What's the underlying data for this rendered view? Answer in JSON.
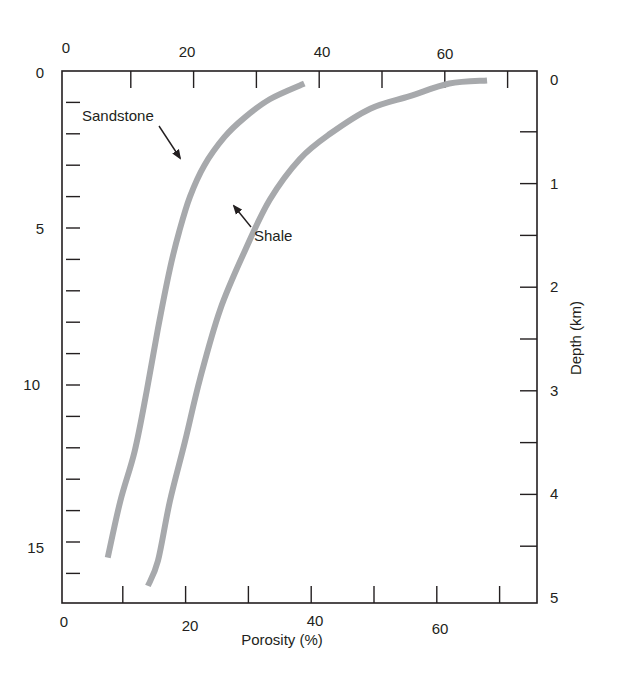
{
  "chart_data": {
    "type": "line",
    "title": "",
    "xlabel": "Porosity (%)",
    "ylabel_left": "",
    "ylabel_right": "Depth (km)",
    "left_axis_unit_note": "depth in thousands of feet (unlabeled)",
    "xlim": [
      0,
      75
    ],
    "ylim_left": [
      0,
      16.9
    ],
    "ylim_right": [
      0,
      5
    ],
    "x_ticks": [
      0,
      10,
      20,
      30,
      40,
      50,
      60,
      70
    ],
    "x_tick_labels_bottom": [
      "0",
      "20",
      "40",
      "60"
    ],
    "x_tick_labels_top": [
      "0",
      "20",
      "40",
      "60"
    ],
    "y_left_ticks": [
      0,
      1,
      2,
      3,
      4,
      5,
      6,
      7,
      8,
      9,
      10,
      11,
      12,
      13,
      14,
      15,
      16
    ],
    "y_left_tick_labels": [
      "0",
      "5",
      "10",
      "15"
    ],
    "y_right_ticks": [
      0,
      0.5,
      1,
      1.5,
      2,
      2.5,
      3,
      3.5,
      4,
      4.5,
      5
    ],
    "y_right_tick_labels": [
      "0",
      "1",
      "2",
      "3",
      "4",
      "5"
    ],
    "grid": false,
    "legend": "none (inline arrow annotations)",
    "series": [
      {
        "name": "Sandstone",
        "color": "#a7a9ac",
        "points": [
          {
            "porosity": 38.9,
            "depth": 0.4
          },
          {
            "porosity": 33.4,
            "depth": 0.9
          },
          {
            "porosity": 29.3,
            "depth": 1.5
          },
          {
            "porosity": 26.2,
            "depth": 2.1
          },
          {
            "porosity": 23.0,
            "depth": 3.0
          },
          {
            "porosity": 20.7,
            "depth": 4.0
          },
          {
            "porosity": 19.0,
            "depth": 5.1
          },
          {
            "porosity": 17.5,
            "depth": 6.3
          },
          {
            "porosity": 15.6,
            "depth": 8.2
          },
          {
            "porosity": 13.8,
            "depth": 10.2
          },
          {
            "porosity": 11.9,
            "depth": 12.1
          },
          {
            "porosity": 9.6,
            "depth": 13.7
          },
          {
            "porosity": 7.6,
            "depth": 15.5
          }
        ]
      },
      {
        "name": "Shale",
        "color": "#a7a9ac",
        "points": [
          {
            "porosity": 68.0,
            "depth": 0.3
          },
          {
            "porosity": 62.0,
            "depth": 0.4
          },
          {
            "porosity": 55.7,
            "depth": 0.8
          },
          {
            "porosity": 49.4,
            "depth": 1.2
          },
          {
            "porosity": 43.0,
            "depth": 2.0
          },
          {
            "porosity": 38.2,
            "depth": 2.8
          },
          {
            "porosity": 33.4,
            "depth": 4.1
          },
          {
            "porosity": 29.5,
            "depth": 5.7
          },
          {
            "porosity": 25.5,
            "depth": 7.6
          },
          {
            "porosity": 22.3,
            "depth": 9.8
          },
          {
            "porosity": 19.9,
            "depth": 11.8
          },
          {
            "porosity": 17.5,
            "depth": 13.7
          },
          {
            "porosity": 15.6,
            "depth": 15.6
          },
          {
            "porosity": 14.0,
            "depth": 16.4
          }
        ]
      }
    ],
    "annotations": [
      {
        "text": "Sandstone",
        "arrow_to": {
          "porosity": 19.1,
          "depth": 2.8
        }
      },
      {
        "text": "Shale",
        "arrow_to": {
          "porosity": 27.5,
          "depth": 4.2
        }
      }
    ]
  },
  "labels": {
    "xlabel": "Porosity (%)",
    "ylabel_right": "Depth (km)",
    "sandstone": "Sandstone",
    "shale": "Shale"
  },
  "colors": {
    "axis": "#231f20",
    "curve": "#a7a9ac",
    "background": "#ffffff"
  }
}
